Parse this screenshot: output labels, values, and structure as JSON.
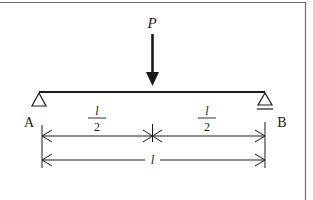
{
  "diagram": {
    "type": "simply-supported-beam",
    "frame": {
      "border_color": "#6e6e6e"
    },
    "colors": {
      "ink": "#1a1a1a",
      "background": "#ffffff"
    },
    "load": {
      "label": "P",
      "position": "midspan",
      "direction": "down"
    },
    "supports": [
      {
        "id": "A",
        "label": "A",
        "kind": "pin"
      },
      {
        "id": "B",
        "label": "B",
        "kind": "roller"
      }
    ],
    "dimensions": {
      "half_left": {
        "numerator": "l",
        "denominator": "2"
      },
      "half_right": {
        "numerator": "l",
        "denominator": "2"
      },
      "total": {
        "label": "l"
      }
    }
  }
}
